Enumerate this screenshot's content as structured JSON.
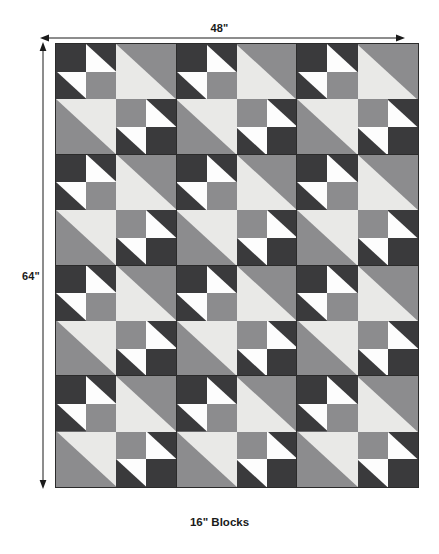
{
  "diagram": {
    "title_caption": "16\" Blocks",
    "top_dimension": "48\"",
    "left_dimension": "64\"",
    "top_arrow_name": "width-dimension-arrow",
    "left_arrow_name": "height-dimension-arrow"
  },
  "palette": {
    "dark": "#3a3a3c",
    "medium": "#8c8c8e",
    "light": "#e9e9e7",
    "white": "#fdfdfd",
    "outline": "#2b2b2b",
    "text": "#1a1a1a",
    "background": "#ffffff"
  },
  "quilt": {
    "blocks_across": 3,
    "blocks_down": 4,
    "block_size_label": "16\"",
    "total_width_label": "48\"",
    "total_height_label": "64\"",
    "block_count": 12,
    "block_name": "quilt-block",
    "block": {
      "description": "16-inch block: four 8-inch quadrants. Two opposite quadrants are 2x2 four-patch units of dark/white half-square triangles with solid squares; the other two are single large half-square triangles in light and medium grey.",
      "quadrants": [
        {
          "name": "top-left-quadrant",
          "type": "four-patch",
          "units": [
            {
              "name": "unit-solid-dark",
              "kind": "solid",
              "bg": "dark"
            },
            {
              "name": "unit-hst-white-dark-ne",
              "kind": "hst",
              "bg": "white",
              "tri": "dark",
              "corner": "ne"
            },
            {
              "name": "unit-hst-white-dark-sw",
              "kind": "hst",
              "bg": "white",
              "tri": "dark",
              "corner": "sw"
            },
            {
              "name": "unit-solid-medium",
              "kind": "solid",
              "bg": "medium"
            }
          ]
        },
        {
          "name": "top-right-quadrant",
          "type": "large-hst",
          "units": [
            {
              "name": "unit-large-hst-light-medium-ne",
              "kind": "hst",
              "bg": "light",
              "tri": "medium",
              "corner": "ne"
            }
          ]
        },
        {
          "name": "bottom-left-quadrant",
          "type": "large-hst",
          "units": [
            {
              "name": "unit-large-hst-light-medium-sw",
              "kind": "hst",
              "bg": "light",
              "tri": "medium",
              "corner": "sw"
            }
          ]
        },
        {
          "name": "bottom-right-quadrant",
          "type": "four-patch",
          "units": [
            {
              "name": "unit-solid-medium",
              "kind": "solid",
              "bg": "medium"
            },
            {
              "name": "unit-hst-white-dark-ne",
              "kind": "hst",
              "bg": "white",
              "tri": "dark",
              "corner": "ne"
            },
            {
              "name": "unit-hst-white-dark-sw",
              "kind": "hst",
              "bg": "white",
              "tri": "dark",
              "corner": "sw"
            },
            {
              "name": "unit-solid-dark",
              "kind": "solid",
              "bg": "dark"
            }
          ]
        }
      ]
    }
  }
}
